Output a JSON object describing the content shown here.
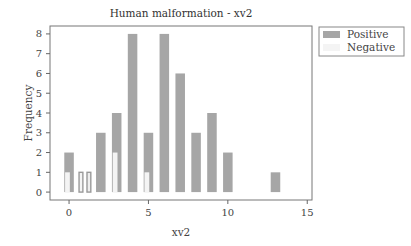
{
  "chart_data": {
    "type": "bar",
    "title": "Human malformation - xv2",
    "xlabel": "xv2",
    "ylabel": "Frequency",
    "xlim": [
      -1.2,
      15.3
    ],
    "ylim": [
      -0.4,
      8.4
    ],
    "xticks": [
      0,
      5,
      10,
      15
    ],
    "yticks": [
      0,
      1,
      2,
      3,
      4,
      5,
      6,
      7,
      8
    ],
    "grid": false,
    "legend_position": "outside-top-right",
    "series": [
      {
        "name": "Positive",
        "color": "#a6a6a6",
        "bars": [
          {
            "x": 0,
            "value": 2
          },
          {
            "x": 1.25,
            "value": 1
          },
          {
            "x": 2,
            "value": 3
          },
          {
            "x": 3,
            "value": 4
          },
          {
            "x": 4,
            "value": 8
          },
          {
            "x": 5,
            "value": 3
          },
          {
            "x": 6,
            "value": 8
          },
          {
            "x": 7,
            "value": 6
          },
          {
            "x": 8,
            "value": 3
          },
          {
            "x": 9,
            "value": 4
          },
          {
            "x": 10,
            "value": 2
          },
          {
            "x": 13,
            "value": 1
          }
        ]
      },
      {
        "name": "Negative",
        "color": "#f4f4f4",
        "bars": [
          {
            "x": 0,
            "value": 1
          },
          {
            "x": 0.75,
            "value": 1
          },
          {
            "x": 3,
            "value": 2
          },
          {
            "x": 5,
            "value": 1
          }
        ]
      }
    ]
  }
}
